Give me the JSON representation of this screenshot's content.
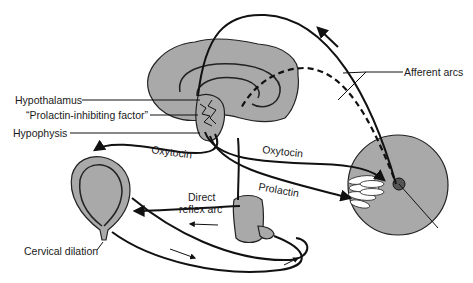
{
  "diagram": {
    "type": "physiology-diagram",
    "colors": {
      "background": "#ffffff",
      "organ_fill": "#a9a9a9",
      "line": "#111111",
      "text": "#1a1a1a"
    },
    "labels": {
      "hypothalamus": "Hypothalamus",
      "prolactin_inhibiting_factor": "“Prolactin-inhibiting factor”",
      "hypophysis": "Hypophysis",
      "afferent_arcs": "Afferent arcs",
      "oxytocin_to_uterus": "Oxytocin",
      "oxytocin_to_breast": "Oxytocin",
      "prolactin": "Prolactin",
      "direct_reflex_arc_line1": "Direct",
      "direct_reflex_arc_line2": "reflex arc",
      "cervical_dilation": "Cervical dilation"
    },
    "structures": [
      {
        "name": "brain",
        "position": "top-center"
      },
      {
        "name": "hypothalamus-hypophysis",
        "position": "center, below brain"
      },
      {
        "name": "spinal-cord-segment",
        "position": "lower-center"
      },
      {
        "name": "uterus",
        "position": "left"
      },
      {
        "name": "breast",
        "position": "right"
      }
    ],
    "pathways": [
      {
        "name": "afferent-arc-solid",
        "from": "breast",
        "to": "brain",
        "style": "solid"
      },
      {
        "name": "afferent-arc-dashed",
        "from": "breast",
        "to": "hypothalamus",
        "style": "dashed"
      },
      {
        "name": "oxytocin-uterus",
        "from": "hypophysis",
        "to": "uterus",
        "style": "solid"
      },
      {
        "name": "oxytocin-breast",
        "from": "hypophysis",
        "to": "breast",
        "style": "solid"
      },
      {
        "name": "prolactin",
        "from": "hypophysis",
        "to": "breast",
        "style": "solid"
      },
      {
        "name": "direct-reflex-arc",
        "from": "spinal-cord",
        "to": "uterus",
        "style": "solid"
      },
      {
        "name": "cervical-afferent",
        "from": "uterus-cervix",
        "to": "spinal-cord",
        "style": "solid"
      }
    ]
  }
}
